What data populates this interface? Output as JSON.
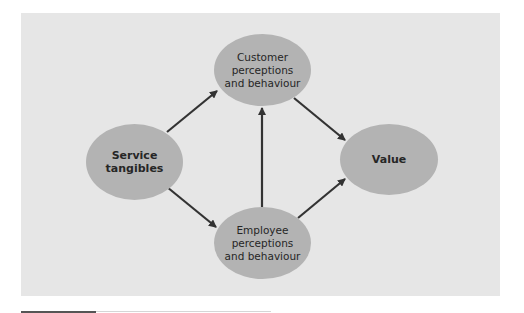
{
  "diagram": {
    "nodes": [
      {
        "id": "customer",
        "label": "Customer\nperceptions\nand behaviour",
        "bold": false
      },
      {
        "id": "service",
        "label": "Service\ntangibles",
        "bold": true
      },
      {
        "id": "value",
        "label": "Value",
        "bold": true
      },
      {
        "id": "employee",
        "label": "Employee\nperceptions\nand behaviour",
        "bold": false
      }
    ],
    "edges": [
      {
        "from": "service",
        "to": "customer"
      },
      {
        "from": "service",
        "to": "employee"
      },
      {
        "from": "employee",
        "to": "customer"
      },
      {
        "from": "customer",
        "to": "value"
      },
      {
        "from": "employee",
        "to": "value"
      }
    ],
    "colors": {
      "background": "#e6e6e6",
      "node_fill": "#b3b3b3",
      "arrow": "#333333",
      "text": "#262626"
    }
  }
}
